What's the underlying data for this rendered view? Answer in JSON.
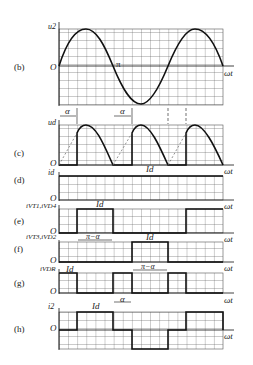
{
  "panels": [
    {
      "id": "b",
      "label": "(b)",
      "ylabel": "u2",
      "origin": "O",
      "xlabel": "ωt",
      "annotations": [
        "π"
      ]
    },
    {
      "id": "c",
      "label": "(c)",
      "ylabel": "ud",
      "origin": "O",
      "xlabel": "ωt",
      "annotations": [
        "α",
        "α"
      ]
    },
    {
      "id": "d",
      "label": "(d)",
      "ylabel": "id",
      "origin": "O",
      "xlabel": "ωt",
      "annotations": [
        "Id"
      ]
    },
    {
      "id": "e",
      "label": "(e)",
      "ylabel": "iVT1,iVD4",
      "origin": "O",
      "xlabel": "ωt",
      "annotations": [
        "Id",
        "π−α"
      ]
    },
    {
      "id": "f",
      "label": "(f)",
      "ylabel": "iVT3,iVD2",
      "origin": "O",
      "xlabel": "ωt",
      "annotations": [
        "Id",
        "π−α"
      ]
    },
    {
      "id": "g",
      "label": "(g)",
      "ylabel": "iVDR",
      "origin": "O",
      "xlabel": "ωt",
      "annotations": [
        "Id",
        "α"
      ]
    },
    {
      "id": "h",
      "label": "(h)",
      "ylabel": "i2",
      "origin": "O",
      "xlabel": "ωt",
      "annotations": [
        "Id"
      ]
    }
  ],
  "colors": {
    "line": "#111111",
    "grid": "#444444"
  }
}
